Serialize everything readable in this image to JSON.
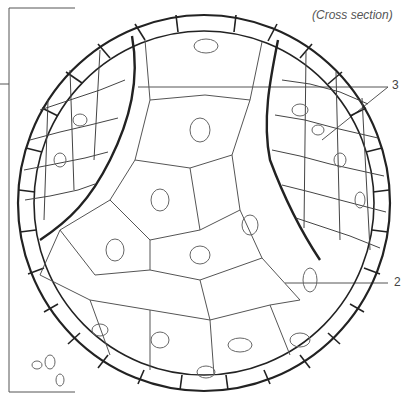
{
  "figure": {
    "caption": "(Cross section)",
    "labels": [
      {
        "id": "3",
        "text": "3",
        "x": 393,
        "y": 80,
        "targets": [
          "left-cell-cluster-boundary",
          "right-cell-cluster-boundary"
        ]
      },
      {
        "id": "2",
        "text": "2",
        "x": 395,
        "y": 277,
        "targets": [
          "large-central-cells"
        ]
      }
    ],
    "bracket": {
      "side": "left",
      "top": 8,
      "bottom": 392,
      "tick_y": 84
    },
    "colors": {
      "stroke": "#222222",
      "thin_stroke": "#555555",
      "label": "#444444",
      "background": "#ffffff"
    }
  }
}
